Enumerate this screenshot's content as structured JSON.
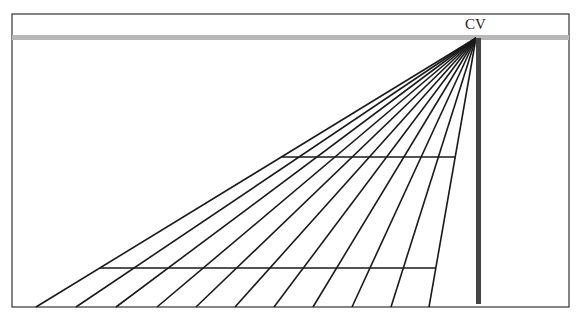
{
  "diagram": {
    "type": "one-point perspective grid",
    "vanishing_point": {
      "label": "CV",
      "x": 476,
      "y": 38
    },
    "frame": {
      "x": 12,
      "y": 14,
      "width": 557,
      "height": 293
    },
    "horizon": {
      "y": 37,
      "thickness": 5,
      "color": "#b8b8b8"
    },
    "post": {
      "x": 478,
      "y_top": 38,
      "y_bottom": 304,
      "width": 4,
      "color": "#444444"
    },
    "ground_y": 307,
    "radiating_lines_bottom_x": [
      36,
      76,
      116,
      157,
      196,
      235,
      274,
      313,
      352,
      391,
      429
    ],
    "transversals_y": [
      157,
      268
    ],
    "line_color": "#1a1a1a"
  },
  "caption": {
    "text": ""
  }
}
